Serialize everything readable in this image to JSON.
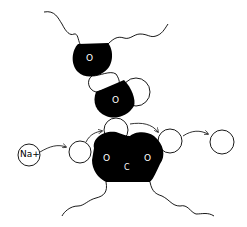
{
  "diagram": {
    "ion": {
      "label": "Na+"
    },
    "upper_group": {
      "oxygen_top": {
        "label": "O"
      },
      "oxygen_bottom": {
        "label": "O"
      }
    },
    "carboxylate": {
      "oxygen_left": {
        "label": "O"
      },
      "carbon": {
        "label": "C"
      },
      "oxygen_right": {
        "label": "O"
      }
    },
    "colors": {
      "fill": "#000000",
      "background": "#ffffff",
      "stroke": "#000000"
    }
  }
}
